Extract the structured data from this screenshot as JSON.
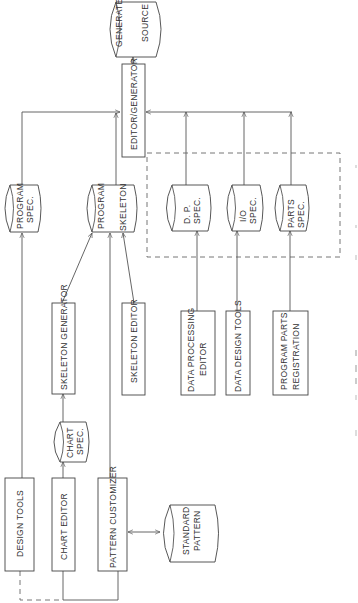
{
  "diagram": {
    "orientation": "rotated-90-ccw",
    "stores": {
      "generated_source": [
        "GENERATED",
        "SOURCE"
      ],
      "program_spec": [
        "PROGRAM",
        "SPEC."
      ],
      "program_skeleton": [
        "PROGRAM",
        "SKELETON"
      ],
      "dp_spec": [
        "D. P.",
        "SPEC."
      ],
      "io_spec": [
        "I/O",
        "SPEC."
      ],
      "parts_spec": [
        "PARTS",
        "SPEC."
      ],
      "chart_spec": [
        "CHART",
        "SPEC."
      ],
      "standard_pattern": [
        "STANDARD",
        "PATTERN"
      ]
    },
    "processes": {
      "editor_generator": "EDITOR/GENERATOR",
      "skeleton_generator": "SKELETON GENERATOR",
      "skeleton_editor": "SKELETON EDITOR",
      "data_processing_editor": [
        "DATA PROCESSING",
        "EDITOR"
      ],
      "data_design_tools": "DATA DESIGN TOOLS",
      "program_parts_registration": [
        "PROGRAM PARTS",
        "REGISTRATION"
      ],
      "design_tools": "DESIGN TOOLS",
      "chart_editor": "CHART EDITOR",
      "pattern_customizer": "PATTERN CUSTOMIZER"
    },
    "edges": [
      {
        "from": "EDITOR/GENERATOR",
        "to": "GENERATED SOURCE"
      },
      {
        "from": "PROGRAM SPEC.",
        "to": "EDITOR/GENERATOR"
      },
      {
        "from": "PROGRAM SKELETON",
        "to": "EDITOR/GENERATOR"
      },
      {
        "from": "D. P. SPEC.",
        "to": "EDITOR/GENERATOR"
      },
      {
        "from": "I/O SPEC.",
        "to": "EDITOR/GENERATOR"
      },
      {
        "from": "PARTS SPEC.",
        "to": "EDITOR/GENERATOR"
      },
      {
        "from": "DESIGN TOOLS",
        "to": "PROGRAM SPEC."
      },
      {
        "from": "SKELETON GENERATOR",
        "to": "PROGRAM SKELETON"
      },
      {
        "from": "PATTERN CUSTOMIZER",
        "to": "PROGRAM SKELETON"
      },
      {
        "from": "SKELETON EDITOR",
        "to": "PROGRAM SKELETON"
      },
      {
        "from": "CHART EDITOR",
        "to": "CHART SPEC."
      },
      {
        "from": "CHART SPEC.",
        "to": "SKELETON GENERATOR"
      },
      {
        "from": "DATA PROCESSING EDITOR",
        "to": "D. P. SPEC."
      },
      {
        "from": "DATA DESIGN TOOLS",
        "to": "I/O SPEC."
      },
      {
        "from": "PROGRAM PARTS REGISTRATION",
        "to": "PARTS SPEC."
      },
      {
        "from": "PATTERN CUSTOMIZER",
        "to": "STANDARD PATTERN",
        "bidirectional": true
      }
    ]
  }
}
